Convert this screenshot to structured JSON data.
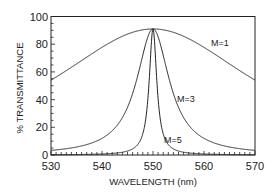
{
  "chart_data": {
    "type": "line",
    "title": "",
    "xlabel": "WAVELENGTH (nm)",
    "ylabel": "% TRANSMITTANCE",
    "xlim": [
      530,
      570
    ],
    "ylim": [
      0,
      100
    ],
    "x_ticks": [
      530,
      540,
      550,
      560,
      570
    ],
    "y_ticks": [
      0,
      20,
      40,
      60,
      80,
      100
    ],
    "grid": false,
    "legend": "inline labels",
    "x": [
      530,
      535,
      540,
      545,
      548,
      549,
      549.5,
      550,
      550.5,
      551,
      552,
      555,
      560,
      565,
      570
    ],
    "series": [
      {
        "name": "M=1",
        "values": [
          54,
          65,
          78,
          88,
          91,
          91,
          91,
          91,
          91,
          91,
          91,
          88,
          78,
          65,
          54
        ]
      },
      {
        "name": "M=3",
        "values": [
          3,
          5,
          12,
          35,
          73,
          86,
          90,
          91,
          90,
          86,
          73,
          35,
          12,
          5,
          3
        ]
      },
      {
        "name": "M=5",
        "values": [
          0,
          0,
          1,
          3,
          15,
          41,
          70,
          91,
          70,
          41,
          15,
          3,
          1,
          0,
          0
        ]
      }
    ],
    "peak": {
      "x": 550,
      "y": 91
    },
    "curve_params": [
      {
        "name": "M=1",
        "center": 550,
        "halfwidth": 24.2,
        "peak": 91
      },
      {
        "name": "M=3",
        "center": 550,
        "halfwidth": 3.9,
        "peak": 91
      },
      {
        "name": "M=5",
        "center": 550,
        "halfwidth": 0.9,
        "peak": 91
      }
    ]
  },
  "labels": {
    "m1": "M=1",
    "m3": "M=3",
    "m5": "M=5",
    "xlabel": "WAVELENGTH (nm)",
    "ylabel": "% TRANSMITTANCE",
    "xticks": [
      "530",
      "540",
      "550",
      "560",
      "570"
    ],
    "yticks": [
      "0",
      "20",
      "40",
      "60",
      "80",
      "100"
    ]
  },
  "colors": {
    "line": "#222222",
    "background": "#ffffff"
  }
}
